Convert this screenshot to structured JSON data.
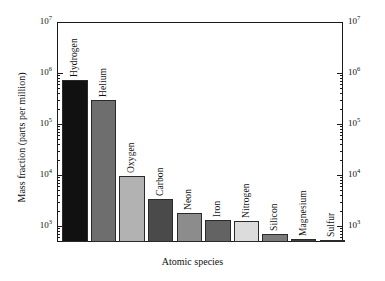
{
  "chart_data": {
    "type": "bar",
    "title": "",
    "xlabel": "Atomic species",
    "ylabel": "Mass fraction (parts per million)",
    "yscale": "log",
    "ylim": [
      500,
      10000000
    ],
    "ylim_note": "axis drawn from below 10^3 baseline up to 10^7",
    "grid": false,
    "legend": "none",
    "y_ticks_major": [
      "10³",
      "10⁶",
      "10⁵",
      "10⁴",
      "10³"
    ],
    "y_tick_labels": [
      {
        "text": "10",
        "exp": "7",
        "value": 10000000
      },
      {
        "text": "10",
        "exp": "6",
        "value": 1000000
      },
      {
        "text": "10",
        "exp": "5",
        "value": 100000
      },
      {
        "text": "10",
        "exp": "4",
        "value": 10000
      },
      {
        "text": "10",
        "exp": "3",
        "value": 1000
      }
    ],
    "y_axis_duplicated_right": true,
    "categories": [
      "Hydrogen",
      "Helium",
      "Oxygen",
      "Carbon",
      "Neon",
      "Iron",
      "Nitrogen",
      "Silicon",
      "Magnesium",
      "Sulfur"
    ],
    "values": [
      740000,
      290000,
      9500,
      3400,
      1800,
      1300,
      1250,
      700,
      560,
      450
    ],
    "colors": [
      "#111111",
      "#6e6e6e",
      "#b2b2b2",
      "#4a4a4a",
      "#8c8c8c",
      "#636363",
      "#dcdcdc",
      "#7a7a7a",
      "#3f3f3f",
      "#5e5e5e"
    ],
    "series": [
      {
        "name": "Mass fraction",
        "points": [
          {
            "label": "Hydrogen",
            "value": 740000,
            "color": "#111111"
          },
          {
            "label": "Helium",
            "value": 290000,
            "color": "#6e6e6e"
          },
          {
            "label": "Oxygen",
            "value": 9500,
            "color": "#b2b2b2"
          },
          {
            "label": "Carbon",
            "value": 3400,
            "color": "#4a4a4a"
          },
          {
            "label": "Neon",
            "value": 1800,
            "color": "#8c8c8c"
          },
          {
            "label": "Iron",
            "value": 1300,
            "color": "#636363"
          },
          {
            "label": "Nitrogen",
            "value": 1250,
            "color": "#dcdcdc"
          },
          {
            "label": "Silicon",
            "value": 700,
            "color": "#7a7a7a"
          },
          {
            "label": "Magnesium",
            "value": 560,
            "color": "#3f3f3f"
          },
          {
            "label": "Sulfur",
            "value": 450,
            "color": "#5e5e5e"
          }
        ]
      }
    ]
  },
  "axes": {
    "x_title": "Atomic species",
    "y_title": "Mass fraction (parts per million)"
  },
  "ticks": {
    "t7_mantissa": "10",
    "t7_exp": "7",
    "t6_mantissa": "10",
    "t6_exp": "6",
    "t5_mantissa": "10",
    "t5_exp": "5",
    "t4_mantissa": "10",
    "t4_exp": "4",
    "t3_mantissa": "10",
    "t3_exp": "3"
  },
  "bar_labels": {
    "b0": "Hydrogen",
    "b1": "Helium",
    "b2": "Oxygen",
    "b3": "Carbon",
    "b4": "Neon",
    "b5": "Iron",
    "b6": "Nitrogen",
    "b7": "Silicon",
    "b8": "Magnesium",
    "b9": "Sulfur"
  }
}
